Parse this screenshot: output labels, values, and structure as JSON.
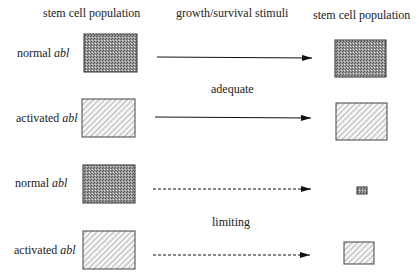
{
  "headers": {
    "left": "stem cell population",
    "middle": "growth/survival stimuli",
    "right": "stem cell population"
  },
  "rows": [
    {
      "label_prefix": "normal ",
      "label_gene": "abl",
      "pattern": "stipple",
      "arrow": "solid",
      "input_box": {
        "x": 84,
        "y": 34,
        "w": 53,
        "h": 38
      },
      "output_box": {
        "x": 335,
        "y": 40,
        "w": 51,
        "h": 37
      },
      "arrow_y": 57,
      "label_y": 51
    },
    {
      "label_prefix": "activated ",
      "label_gene": "abl",
      "pattern": "hatch",
      "arrow": "solid",
      "input_box": {
        "x": 82,
        "y": 99,
        "w": 53,
        "h": 38
      },
      "output_box": {
        "x": 336,
        "y": 103,
        "w": 51,
        "h": 37
      },
      "arrow_y": 117,
      "label_y": 116
    },
    {
      "label_prefix": "normal ",
      "label_gene": "abl",
      "pattern": "stipple",
      "arrow": "dashed",
      "input_box": {
        "x": 83,
        "y": 165,
        "w": 52,
        "h": 38
      },
      "output_box": {
        "x": 356,
        "y": 187,
        "w": 11,
        "h": 7
      },
      "arrow_y": 189,
      "label_y": 181
    },
    {
      "label_prefix": "activated ",
      "label_gene": "abl",
      "pattern": "hatch",
      "arrow": "dashed",
      "input_box": {
        "x": 83,
        "y": 231,
        "w": 52,
        "h": 38
      },
      "output_box": {
        "x": 343,
        "y": 242,
        "w": 31,
        "h": 22
      },
      "arrow_y": 255,
      "label_y": 248
    }
  ],
  "conditions": {
    "adequate": "adequate",
    "limiting": "limiting"
  },
  "colors": {
    "stroke": "#333333",
    "stipple_fill": "#8a8a8a",
    "hatch_line": "#777777",
    "arrow": "#111111"
  }
}
